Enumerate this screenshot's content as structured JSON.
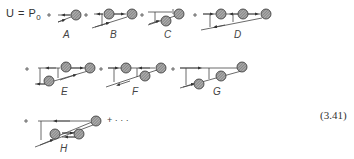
{
  "equation": {
    "lhs": "U = P",
    "subscript": "0",
    "number": "(3.41)",
    "trailing": "+ · · ·"
  },
  "terms": [
    {
      "label": "A"
    },
    {
      "label": "B"
    },
    {
      "label": "C"
    },
    {
      "label": "D"
    },
    {
      "label": "E"
    },
    {
      "label": "F"
    },
    {
      "label": "G"
    },
    {
      "label": "H"
    }
  ],
  "colors": {
    "line": "#444444",
    "ball_fill": "#8a8a8a",
    "ball_stroke": "#333333"
  }
}
